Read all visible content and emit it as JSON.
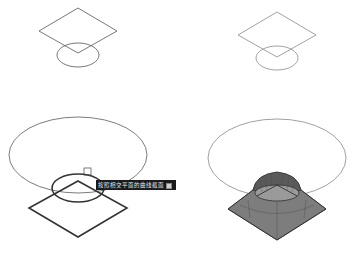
{
  "figure": {
    "colors": {
      "background": "#ffffff",
      "thin_stroke": "#555555",
      "light_stroke": "#8a8a8a",
      "bold_stroke": "#333333",
      "solid_fill": "#7d7d7d",
      "solid_cap_fill": "#5a5a5a",
      "solid_inner_fill": "#9a9a9a",
      "tooltip_bg": "#1a1a1a",
      "tooltip_text": "#e8e8e8"
    },
    "panels": [
      {
        "id": "top-left",
        "shapes": [
          "diamond",
          "ellipse"
        ]
      },
      {
        "id": "top-right",
        "shapes": [
          "diamond",
          "ellipse"
        ]
      },
      {
        "id": "bottom-left",
        "shapes": [
          "large-ellipse",
          "bold-diamond",
          "bold-ellipse",
          "pick-box",
          "tooltip"
        ]
      },
      {
        "id": "bottom-right",
        "shapes": [
          "large-ellipse",
          "lofted-solid"
        ]
      }
    ],
    "tooltip": {
      "text": "按照相交平面的曲线截面选择",
      "icon": "options-icon"
    }
  }
}
